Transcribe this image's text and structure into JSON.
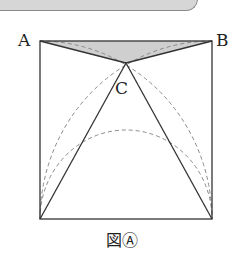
{
  "figure": {
    "caption": "図Ⓐ",
    "labels": {
      "A": "A",
      "B": "B",
      "C": "C"
    },
    "shape": "square with inscribed arcs and triangle; shaded region triangle ABC",
    "colors": {
      "line": "#333333",
      "dashed": "#888888",
      "shade": "#cfcfcf",
      "banner": "#d6d6d6"
    }
  }
}
